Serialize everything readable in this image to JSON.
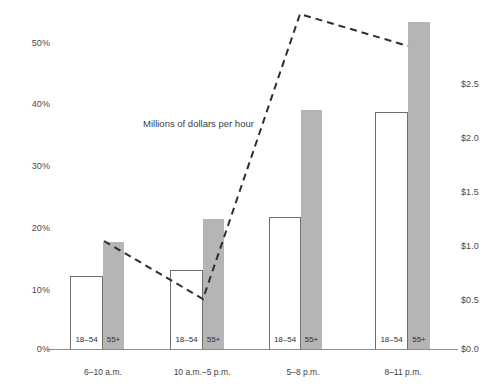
{
  "chart_data": {
    "type": "bar",
    "title": "",
    "annotation": "Millions of dollars per hour",
    "categories": [
      "6–10 a.m.",
      "10 a.m.–5 p.m.",
      "5–8 p.m.",
      "8–11 p.m."
    ],
    "series": [
      {
        "name": "18–54",
        "style": "open-bar",
        "axis": "left",
        "values": [
          12.3,
          13.5,
          21.8,
          39.0
        ]
      },
      {
        "name": "55+",
        "style": "filled-bar",
        "axis": "left",
        "values": [
          17.7,
          21.3,
          39.2,
          53.6
        ]
      },
      {
        "name": "Millions of dollars per hour",
        "style": "dashed-line",
        "axis": "right",
        "values": [
          0.88,
          0.4,
          2.75,
          2.48
        ]
      }
    ],
    "left_axis": {
      "label": "",
      "ticks": [
        "0%",
        "10%",
        "20%",
        "30%",
        "40%",
        "50%"
      ],
      "values": [
        0,
        10,
        20,
        30,
        40,
        50
      ],
      "ylim": [
        0,
        50
      ]
    },
    "right_axis": {
      "label": "Millions of dollars per hour",
      "ticks": [
        "$0.0",
        "$0.5",
        "$1.0",
        "$1.5",
        "$2.0",
        "$2.5"
      ],
      "values": [
        0.0,
        0.5,
        1.0,
        1.5,
        2.0,
        2.5
      ],
      "ylim": [
        0,
        2.75
      ]
    },
    "grid": false,
    "legend": "inline-bar-labels",
    "colors": {
      "filled_bar": "#b5b5b5",
      "open_bar_border": "#6f6f6f",
      "line": "#333333",
      "axis": "#8d8d8d",
      "text": "#3f3f3f",
      "background": "#ffffff"
    }
  },
  "left_ticks": [
    {
      "label": "50%",
      "top": 38
    },
    {
      "label": "40%",
      "top": 99
    },
    {
      "label": "30%",
      "top": 161
    },
    {
      "label": "20%",
      "top": 223
    },
    {
      "label": "10%",
      "top": 285
    },
    {
      "label": "0%",
      "top": 344
    }
  ],
  "right_ticks": [
    {
      "label": "$2.5",
      "top": 79
    },
    {
      "label": "$2.0",
      "top": 133
    },
    {
      "label": "$1.5",
      "top": 187
    },
    {
      "label": "$1.0",
      "top": 241
    },
    {
      "label": "$0.5",
      "top": 295
    },
    {
      "label": "$0.0",
      "top": 344
    }
  ],
  "groups": [
    {
      "category": "6–10 a.m.",
      "cat_left": 58,
      "cat_width": 90,
      "open": {
        "left": 70,
        "width": 33,
        "top": 276,
        "tag": "18–54",
        "value": 12.3
      },
      "filled": {
        "left": 103,
        "width": 21,
        "top": 242,
        "tag": "55+",
        "value": 17.7
      }
    },
    {
      "category": "10 a.m.–5 p.m.",
      "cat_left": 152,
      "cat_width": 100,
      "open": {
        "left": 170,
        "width": 33,
        "top": 270,
        "tag": "18–54",
        "value": 13.5
      },
      "filled": {
        "left": 203,
        "width": 21,
        "top": 219,
        "tag": "55+",
        "value": 21.3
      }
    },
    {
      "category": "5–8 p.m.",
      "cat_left": 258,
      "cat_width": 90,
      "open": {
        "left": 269,
        "width": 32,
        "top": 217,
        "tag": "18–54",
        "value": 21.8
      },
      "filled": {
        "left": 301,
        "width": 21,
        "top": 110,
        "tag": "55+",
        "value": 39.2
      }
    },
    {
      "category": "8–11 p.m.",
      "cat_left": 358,
      "cat_width": 90,
      "open": {
        "left": 375,
        "width": 33,
        "top": 112,
        "tag": "18–54",
        "value": 39.0
      },
      "filled": {
        "left": 408,
        "width": 22,
        "top": 22,
        "tag": "55+",
        "value": 53.6
      }
    }
  ],
  "annotation": {
    "text": "Millions of dollars per hour",
    "left": 143,
    "top": 118
  },
  "line_points": "104,241 203,299 300,14 408,46"
}
